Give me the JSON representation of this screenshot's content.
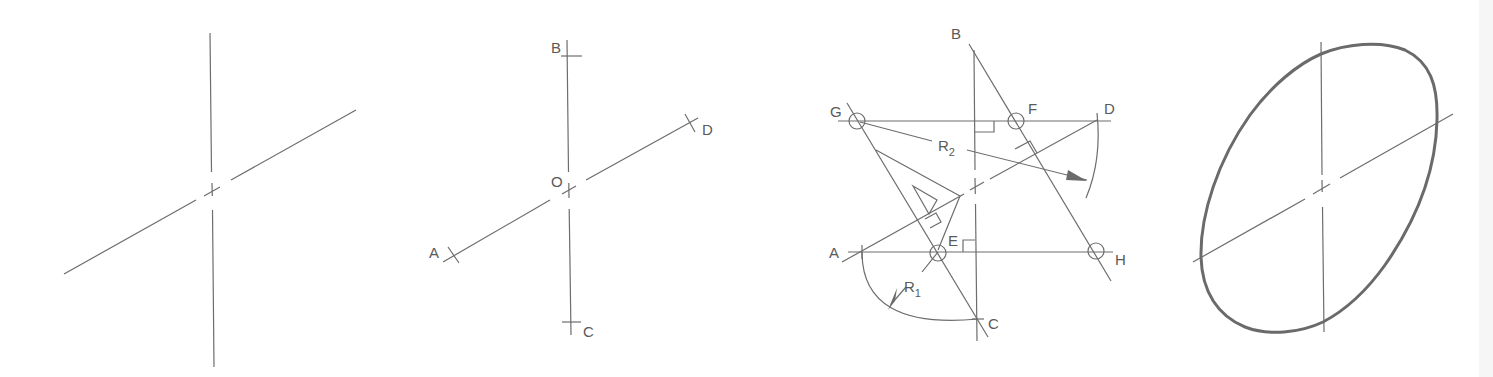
{
  "figure": {
    "stroke_color": "#6d6d6d",
    "background": "#ffffff"
  },
  "panels": [
    {
      "id": "step-1",
      "description": "Conjugate axes drawn"
    },
    {
      "id": "step-2",
      "description": "Axes marked with endpoints",
      "labels": {
        "b": "B",
        "o": "O",
        "d": "D",
        "a": "A",
        "c": "C"
      }
    },
    {
      "id": "step-3",
      "description": "Construction of centers and radii",
      "labels": {
        "b": "B",
        "g": "G",
        "f": "F",
        "d": "D",
        "r2": "R",
        "r2_sub": "2",
        "a": "A",
        "e": "E",
        "h": "H",
        "r1": "R",
        "r1_sub": "1",
        "c": "C"
      }
    },
    {
      "id": "step-4",
      "description": "Completed approximate ellipse"
    }
  ]
}
